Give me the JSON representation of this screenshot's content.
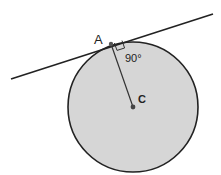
{
  "diagram": {
    "circle": {
      "cx": 133,
      "cy": 107,
      "r": 65,
      "fill": "#d6d6d6",
      "stroke": "#222222"
    },
    "tangent_line": {
      "x1": 11,
      "y1": 79,
      "x2": 213,
      "y2": 14,
      "stroke": "#222222"
    },
    "point_a": {
      "label": "A",
      "x": 111,
      "y": 44
    },
    "point_c": {
      "label": "C",
      "x": 133,
      "y": 107
    },
    "radius_segment": {
      "from": "A",
      "to": "C"
    },
    "angle_label": "90°"
  }
}
